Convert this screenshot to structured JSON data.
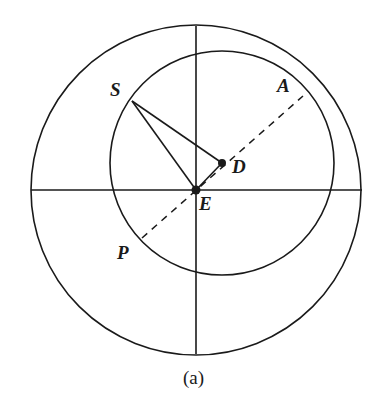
{
  "figure": {
    "caption": "(a)",
    "background_color": "#ffffff",
    "stroke_color": "#1a1a1a"
  },
  "geometry": {
    "canvas": {
      "width": 387,
      "height": 411
    },
    "outer_circle": {
      "name": "outer-circle",
      "center": {
        "x": 196,
        "y": 190
      },
      "radius": 165,
      "stroke_width": 1.6,
      "style": "solid"
    },
    "inner_circle": {
      "name": "inner-circle",
      "center": {
        "x": 222,
        "y": 163
      },
      "radius": 112,
      "stroke_width": 1.6,
      "style": "solid"
    },
    "horizontal_axis": {
      "name": "horizontal-axis",
      "x1": 31,
      "y1": 190,
      "x2": 362,
      "y2": 190,
      "stroke_width": 1.6,
      "style": "solid"
    },
    "vertical_axis": {
      "name": "vertical-axis",
      "x1": 196,
      "y1": 26,
      "x2": 196,
      "y2": 354,
      "stroke_width": 1.6,
      "style": "solid"
    },
    "segment_s_to_e": {
      "name": "segment-S-E",
      "x1": 132,
      "y1": 101,
      "x2": 196,
      "y2": 190,
      "stroke_width": 1.6,
      "style": "solid"
    },
    "segment_s_to_d": {
      "name": "segment-S-D",
      "x1": 132,
      "y1": 101,
      "x2": 222,
      "y2": 163,
      "stroke_width": 1.6,
      "style": "solid"
    },
    "segment_e_to_d": {
      "name": "segment-E-D",
      "x1": 196,
      "y1": 190,
      "x2": 222,
      "y2": 163,
      "stroke_width": 1.6,
      "style": "solid"
    },
    "apse_line_dashed": {
      "name": "apse-line",
      "x1": 142,
      "y1": 238,
      "x2": 303,
      "y2": 96,
      "stroke_width": 1.5,
      "style": "dashed",
      "dash_pattern": "7 6"
    },
    "points": [
      {
        "id": "S",
        "x": 132,
        "y": 101,
        "marker": false
      },
      {
        "id": "A",
        "x": 303,
        "y": 96,
        "marker": false
      },
      {
        "id": "D",
        "x": 222,
        "y": 163,
        "marker": true,
        "marker_radius": 4
      },
      {
        "id": "E",
        "x": 196,
        "y": 190,
        "marker": true,
        "marker_radius": 4.5
      },
      {
        "id": "P",
        "x": 142,
        "y": 238,
        "marker": false
      }
    ]
  },
  "labels": {
    "S": {
      "text": "S",
      "left": 110,
      "top": 80
    },
    "A": {
      "text": "A",
      "left": 277,
      "top": 76
    },
    "D": {
      "text": "D",
      "left": 232,
      "top": 157
    },
    "E": {
      "text": "E",
      "left": 199,
      "top": 194
    },
    "P": {
      "text": "P",
      "left": 117,
      "top": 243
    }
  }
}
